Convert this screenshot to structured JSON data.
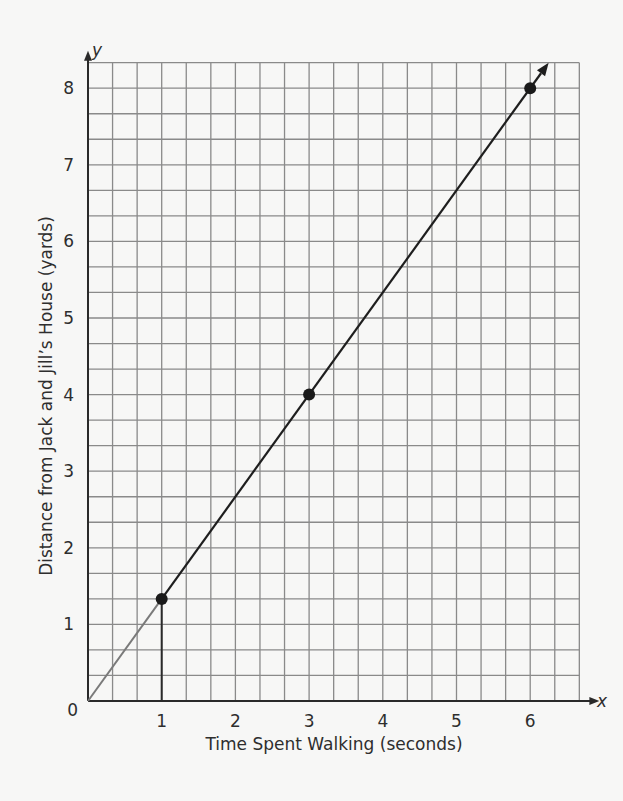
{
  "chart_data": {
    "type": "line",
    "title": "",
    "xlabel": "Time Spent Walking (seconds)",
    "ylabel": "Distance from Jack and Jill’s House (yards)",
    "x_axis_letter": "x",
    "y_axis_letter": "y",
    "origin_label": "0",
    "x_ticks": [
      1,
      2,
      3,
      4,
      5,
      6
    ],
    "y_ticks": [
      1,
      2,
      3,
      4,
      5,
      6,
      7,
      8
    ],
    "xlim": [
      0,
      6.667
    ],
    "ylim": [
      0,
      8.333
    ],
    "grid": true,
    "grid_subdivisions_per_unit": {
      "x": 3,
      "y": 3
    },
    "series": [
      {
        "name": "distance",
        "x": [
          0,
          1,
          3,
          6
        ],
        "y": [
          0,
          1.333,
          4,
          8
        ],
        "points_marked": [
          {
            "x": 1,
            "y": 1.333
          },
          {
            "x": 3,
            "y": 4
          },
          {
            "x": 6,
            "y": 8
          }
        ],
        "arrow_end": {
          "x": 6.25,
          "y": 8.333
        }
      }
    ],
    "annotations": [
      {
        "type": "vertical-segment",
        "x": 1,
        "y_from": 0,
        "y_to": 1.333
      }
    ],
    "legend": null
  },
  "colors": {
    "background": "#f7f7f6",
    "grid": "#8a8a8a",
    "axis": "#2a2a2a",
    "line_dark": "#1e1e1e",
    "line_light": "#7a7a7a",
    "point": "#1a1a1a"
  }
}
